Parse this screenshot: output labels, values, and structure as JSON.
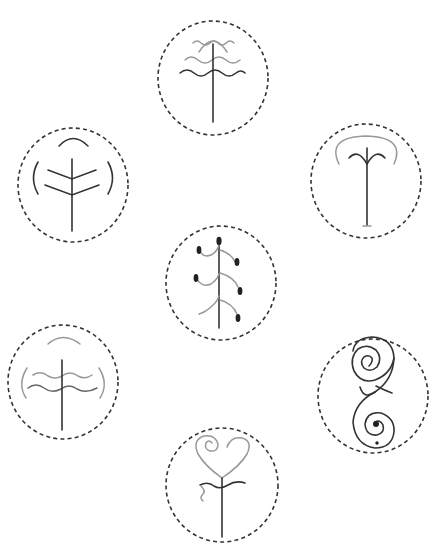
{
  "caption": "",
  "colors": {
    "background": "#ffffff",
    "ring": "#333333",
    "stroke_dark": "#333333",
    "stroke_mid": "#666666",
    "stroke_light": "#999999"
  },
  "symbols": [
    {
      "id": "top",
      "label": "layered-wave-tree",
      "cx": 213,
      "cy": 78
    },
    {
      "id": "upper-left",
      "label": "chevron-branch-tree",
      "cx": 73,
      "cy": 185
    },
    {
      "id": "upper-right",
      "label": "canopy-sprout",
      "cx": 366,
      "cy": 181
    },
    {
      "id": "center",
      "label": "seed-pod-stalk",
      "cx": 221,
      "cy": 283
    },
    {
      "id": "lower-left",
      "label": "double-wave-tree",
      "cx": 63,
      "cy": 382
    },
    {
      "id": "lower-right",
      "label": "double-spiral",
      "cx": 373,
      "cy": 396
    },
    {
      "id": "bottom",
      "label": "heart-spiral-stem",
      "cx": 222,
      "cy": 485
    }
  ]
}
